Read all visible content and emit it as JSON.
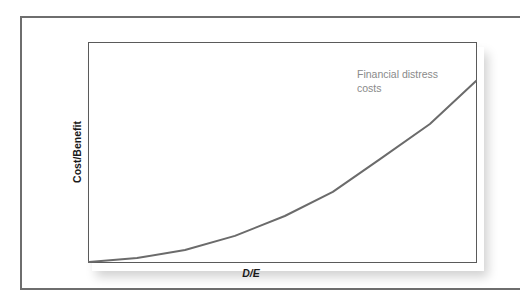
{
  "chart_data": {
    "type": "line",
    "title": "",
    "xlabel": "D/E",
    "ylabel": "Cost/Benefit",
    "xlim": [
      0,
      1
    ],
    "ylim": [
      0,
      1
    ],
    "grid": false,
    "legend": "none",
    "x": [
      0,
      0.124,
      0.248,
      0.377,
      0.506,
      0.63,
      0.752,
      0.881,
      1.0
    ],
    "series": [
      {
        "name": "Financial distress costs",
        "values": [
          0,
          0.018,
          0.055,
          0.119,
          0.21,
          0.32,
          0.47,
          0.63,
          0.827
        ],
        "color": "#6b6b6b"
      }
    ],
    "annotations": [
      {
        "text": "Financial distress costs",
        "near_x": 0.69,
        "near_y": 0.85
      }
    ],
    "tick_labels": {
      "x": [],
      "y": []
    }
  },
  "axes": {
    "x_label": "D/E",
    "y_label": "Cost/Benefit"
  },
  "series_label": {
    "line1": "Financial distress",
    "line2": "costs"
  },
  "colors": {
    "curve": "#6b6b6b",
    "frame": "#6e6e6e",
    "plot_border": "#5a5a5a",
    "series_label": "#8a8a8a",
    "axis_label": "#1a1a1a"
  },
  "layout": {
    "plot_px": {
      "left": 89,
      "top": 43,
      "right": 476,
      "bottom": 262
    }
  }
}
